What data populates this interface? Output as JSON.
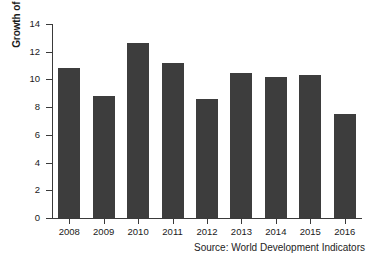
{
  "figure": {
    "title_cropped": "",
    "source_note": "Source: World Development Indicators"
  },
  "axes": {
    "y_title": "Growth of real GDP (% p.a.)",
    "y_ticks": [
      "0",
      "2",
      "4",
      "6",
      "8",
      "10",
      "12",
      "14"
    ],
    "x_ticks": [
      "2008",
      "2009",
      "2010",
      "2011",
      "2012",
      "2013",
      "2014",
      "2015",
      "2016"
    ]
  },
  "style": {
    "bar_color": "#3d3d3d",
    "axis_color": "#3a3a3a",
    "background": "#ffffff",
    "text_color": "#1a1a1a"
  },
  "chart_data": {
    "type": "bar",
    "title": "",
    "xlabel": "",
    "ylabel": "Growth of real GDP (% p.a.)",
    "categories": [
      "2008",
      "2009",
      "2010",
      "2011",
      "2012",
      "2013",
      "2014",
      "2015",
      "2016"
    ],
    "values": [
      10.8,
      8.8,
      12.6,
      11.2,
      8.6,
      10.5,
      10.2,
      10.3,
      7.5
    ],
    "ylim": [
      0,
      14
    ],
    "yticks": [
      0,
      2,
      4,
      6,
      8,
      10,
      12,
      14
    ],
    "grid": false,
    "legend": null,
    "source": "Source: World Development Indicators"
  }
}
